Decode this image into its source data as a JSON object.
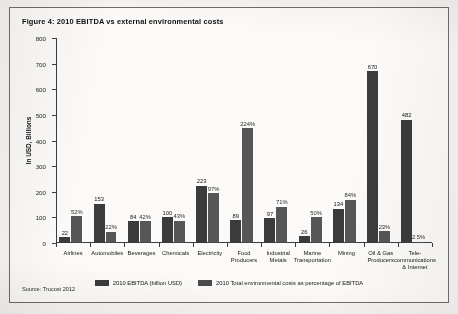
{
  "figure": {
    "title": "Figure 4: 2010 EBITDA vs external environmental costs",
    "source": "Source: Trucost 2012"
  },
  "legend": {
    "items": [
      {
        "key": "s1",
        "label": "2010 EBITDA (billion USD)",
        "color": "#3b3b3b"
      },
      {
        "key": "s2",
        "label": "2010 Total environmental costs as percentage of EBITDA",
        "color": "#4a4a4a"
      }
    ]
  },
  "chart_data": {
    "type": "bar",
    "title": "Figure 4: 2010 EBITDA vs external environmental costs",
    "xlabel": "",
    "ylabel": "In USD, Billions",
    "ylim": [
      0,
      800
    ],
    "yticks": [
      0,
      100,
      200,
      300,
      400,
      500,
      600,
      700,
      800
    ],
    "grid": false,
    "legend_position": "bottom",
    "categories": [
      "Airlines",
      "Automobiles",
      "Beverages",
      "Chemicals",
      "Electricity",
      "Food\nProducers",
      "Industrial\nMetals",
      "Marine\nTransportation",
      "Mining",
      "Oil & Gas\nProducers",
      "Tele-\ncommunications\n& Internet"
    ],
    "series": [
      {
        "name": "2010 EBITDA (billion USD)",
        "unit": "billion USD",
        "values": [
          22,
          153,
          84,
          100,
          223,
          89,
          97,
          26,
          134,
          670,
          482
        ],
        "labels": [
          "22",
          "153",
          "84",
          "100",
          "223",
          "89",
          "97",
          "26",
          "134",
          "670",
          "482"
        ]
      },
      {
        "name": "2010 Total environmental costs as percentage of EBITDA",
        "unit": "percent",
        "values": [
          52,
          22,
          42,
          43,
          97,
          224,
          71,
          50,
          84,
          23,
          2.5
        ],
        "labels": [
          "52%",
          "22%",
          "42%",
          "43%",
          "97%",
          "224%",
          "71%",
          "50%",
          "84%",
          "23%",
          "2.5%"
        ]
      }
    ]
  }
}
